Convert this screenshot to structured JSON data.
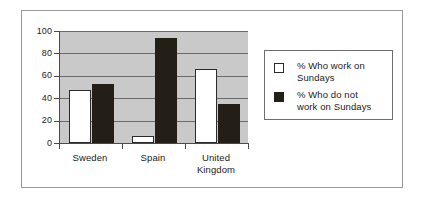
{
  "chart_data": {
    "type": "bar",
    "title": "",
    "subtitle": "",
    "xlabel": "",
    "ylabel": "",
    "categories": [
      "Sweden",
      "Spain",
      "United Kingdom"
    ],
    "series": [
      {
        "name": "% Who work on Sundays",
        "values": [
          47,
          6,
          66
        ],
        "color": "#ffffff",
        "edge_color": "#2b2b2b"
      },
      {
        "name": "% Who do not work on Sundays",
        "values": [
          53,
          94,
          35
        ],
        "color": "#231f16",
        "edge_color": "#231f16"
      }
    ],
    "ylim": [
      0,
      100
    ],
    "yticks": [
      0,
      20,
      40,
      60,
      80,
      100
    ],
    "ytick_labels": [
      "0",
      "20",
      "40",
      "60",
      "80",
      "100"
    ],
    "grid": true,
    "grid_axis": "y",
    "legend_position": "right",
    "plot_background": "#c9c9c9",
    "figure_background": "#ffffff",
    "frame_color": "#9a9a9a"
  },
  "axis": {
    "ticks": [
      {
        "label": "100",
        "value": 100
      },
      {
        "label": "80",
        "value": 80
      },
      {
        "label": "60",
        "value": 60
      },
      {
        "label": "40",
        "value": 40
      },
      {
        "label": "20",
        "value": 20
      },
      {
        "label": "0",
        "value": 0
      }
    ]
  },
  "categories": [
    {
      "label": "Sweden",
      "line1": "Sweden",
      "line2": ""
    },
    {
      "label": "Spain",
      "line1": "Spain",
      "line2": ""
    },
    {
      "label": "United Kingdom",
      "line1": "United",
      "line2": "Kingdom"
    }
  ],
  "legend": {
    "entries": [
      {
        "label": "% Who work on Sundays",
        "line1": "% Who work on",
        "line2": "Sundays",
        "swatch": "white-square-swatch"
      },
      {
        "label": "% Who do not work on Sundays",
        "line1": "% Who do not",
        "line2": "work on Sundays",
        "swatch": "black-square-swatch"
      }
    ]
  }
}
